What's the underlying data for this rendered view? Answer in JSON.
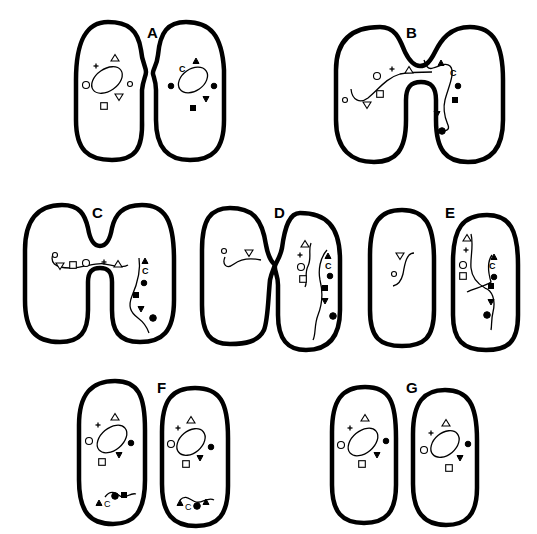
{
  "diagram": {
    "type": "bacterial conjugation stages",
    "panels": [
      {
        "id": "A",
        "label": "A",
        "description": "Two separate cells approaching, each with circular chromosome"
      },
      {
        "id": "B",
        "label": "B",
        "description": "Cells fused by bridge; donor chromosome transferring through bridge"
      },
      {
        "id": "C",
        "label": "C",
        "description": "Donor linear strand entering recipient through bridge"
      },
      {
        "id": "D",
        "label": "D",
        "description": "Cells separating; donor fragment aligned beside recipient chromosome"
      },
      {
        "id": "E",
        "label": "E",
        "description": "Cells separated; recombination crossover in recipient"
      },
      {
        "id": "F",
        "label": "F",
        "description": "Daughter cells with circular chromosome and excised fragment"
      },
      {
        "id": "G",
        "label": "G",
        "description": "Two recombinant cells with circular chromosomes"
      }
    ],
    "gene_markers": {
      "donor": [
        "open-circle-small",
        "open-triangle-up",
        "plus",
        "open-circle",
        "open-square",
        "open-triangle-down"
      ],
      "recipient": [
        "solid-triangle-up",
        "C",
        "solid-circle",
        "solid-square",
        "solid-triangle-down",
        "solid-circle-large"
      ],
      "c_label": "C"
    }
  }
}
